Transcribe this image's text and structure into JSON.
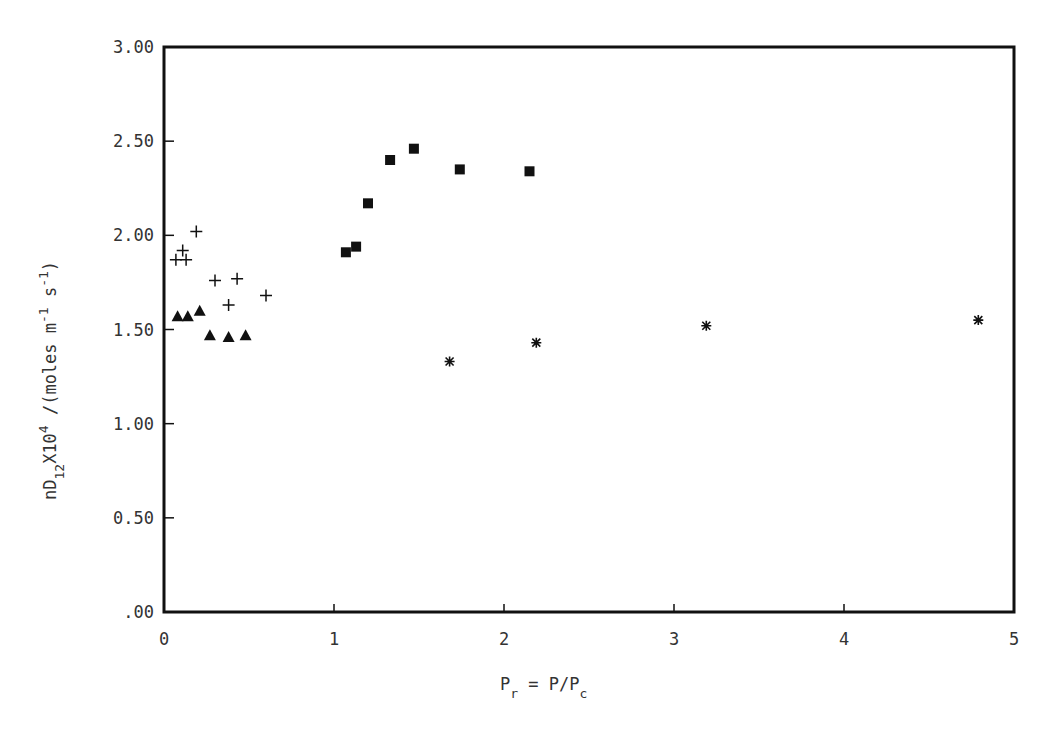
{
  "chart_data": {
    "type": "scatter",
    "title": "",
    "xlabel": "P_r = P/P_c",
    "ylabel": "nD_12 x 10^4 / (moles m^-1 s^-1)",
    "xlim": [
      0,
      5
    ],
    "ylim": [
      0,
      3.0
    ],
    "grid": false,
    "legend": null,
    "x_ticks": [
      0,
      1,
      2,
      3,
      4,
      5
    ],
    "x_tick_labels": [
      "0",
      "1",
      "2",
      "3",
      "4",
      "5"
    ],
    "y_ticks": [
      0,
      0.5,
      1.0,
      1.5,
      2.0,
      2.5,
      3.0
    ],
    "y_tick_labels": [
      ".00",
      "0.50",
      "1.00",
      "1.50",
      "2.00",
      "2.50",
      "3.00"
    ],
    "series": [
      {
        "name": "plus",
        "marker": "plus",
        "x": [
          0.07,
          0.11,
          0.13,
          0.19,
          0.3,
          0.38,
          0.43,
          0.6
        ],
        "y": [
          1.87,
          1.92,
          1.87,
          2.02,
          1.76,
          1.63,
          1.77,
          1.68
        ]
      },
      {
        "name": "triangle",
        "marker": "filled-triangle",
        "x": [
          0.08,
          0.14,
          0.21,
          0.27,
          0.38,
          0.48
        ],
        "y": [
          1.57,
          1.57,
          1.6,
          1.47,
          1.46,
          1.47
        ]
      },
      {
        "name": "square",
        "marker": "filled-square",
        "x": [
          1.07,
          1.13,
          1.2,
          1.33,
          1.47,
          1.74,
          2.15
        ],
        "y": [
          1.91,
          1.94,
          2.17,
          2.4,
          2.46,
          2.35,
          2.34
        ]
      },
      {
        "name": "asterisk",
        "marker": "asterisk",
        "x": [
          1.68,
          2.19,
          3.19,
          4.79
        ],
        "y": [
          1.33,
          1.43,
          1.52,
          1.55
        ]
      }
    ]
  },
  "axes": {
    "x_title": {
      "main": "P",
      "sub": "r",
      "rest": " = P/P",
      "sub2": "c"
    },
    "y_title": {
      "pre": "nD",
      "sub": "12",
      "mid": "X10",
      "sup": "4",
      "post": " /(moles m",
      "sup2": "-1",
      "post2": " s",
      "sup3": "-1",
      "end": ")"
    }
  },
  "colors": {
    "ink": "#111111",
    "text": "#333333",
    "background": "#ffffff"
  }
}
